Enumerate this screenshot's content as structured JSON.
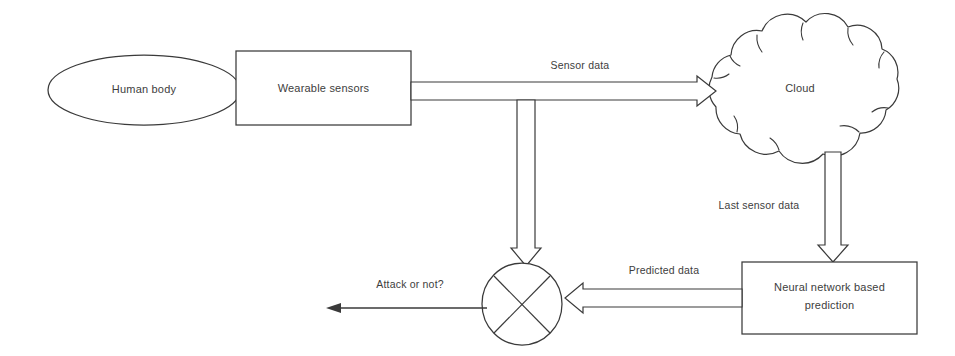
{
  "diagram": {
    "background_color": "#ffffff",
    "stroke_color": "#3a3a3a",
    "text_color": "#3d3d3d",
    "nodes": [
      {
        "id": "human-body",
        "label": "Human body",
        "shape": "ellipse"
      },
      {
        "id": "wearable",
        "label": "Wearable sensors",
        "shape": "rectangle"
      },
      {
        "id": "cloud",
        "label": "Cloud",
        "shape": "cloud"
      },
      {
        "id": "neural-network",
        "label_line1": "Neural network based",
        "label_line2": "prediction",
        "shape": "rectangle"
      },
      {
        "id": "comparator",
        "label": "",
        "shape": "circle-with-x"
      }
    ],
    "edges": [
      {
        "id": "sensor-data",
        "label": "Sensor data",
        "from": "wearable",
        "to": "cloud",
        "style": "block-arrow",
        "direction": "right"
      },
      {
        "id": "branch-to-compare",
        "label": "",
        "from": "sensor-data",
        "to": "comparator",
        "style": "block-arrow",
        "direction": "down"
      },
      {
        "id": "last-sensor-data",
        "label": "Last sensor data",
        "from": "cloud",
        "to": "neural-network",
        "style": "block-arrow",
        "direction": "down"
      },
      {
        "id": "predicted-data",
        "label": "Predicted data",
        "from": "neural-network",
        "to": "comparator",
        "style": "block-arrow",
        "direction": "left"
      },
      {
        "id": "attack-or-not",
        "label": "Attack or not?",
        "from": "comparator",
        "to": "output",
        "style": "thin-arrow",
        "direction": "left"
      }
    ]
  }
}
